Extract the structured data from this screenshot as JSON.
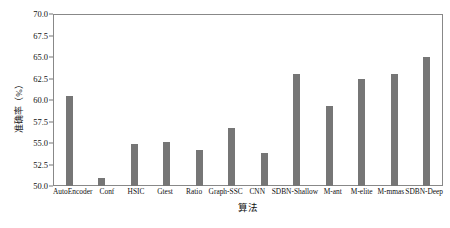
{
  "chart_data": {
    "type": "bar",
    "title": "",
    "xlabel": "算法",
    "ylabel": "准确率（%）",
    "ylim": [
      50.0,
      70.0
    ],
    "yticks": [
      "50.0",
      "52.5",
      "55.0",
      "57.5",
      "60.0",
      "62.5",
      "65.0",
      "67.5",
      "70.0"
    ],
    "ytick_values": [
      50.0,
      52.5,
      55.0,
      57.5,
      60.0,
      62.5,
      65.0,
      67.5,
      70.0
    ],
    "grid": false,
    "legend": "none",
    "bar_color": "#767676",
    "categories": [
      "AutoEncoder",
      "Conf",
      "HSIC",
      "Gtest",
      "Ratio",
      "Graph-SSC",
      "CNN",
      "SDBN-Shallow",
      "M-ant",
      "M-elite",
      "M-mmas",
      "SDBN-Deep"
    ],
    "values": [
      60.5,
      50.9,
      54.9,
      55.1,
      54.2,
      56.8,
      53.8,
      63.0,
      59.3,
      62.5,
      63.0,
      65.0
    ]
  }
}
